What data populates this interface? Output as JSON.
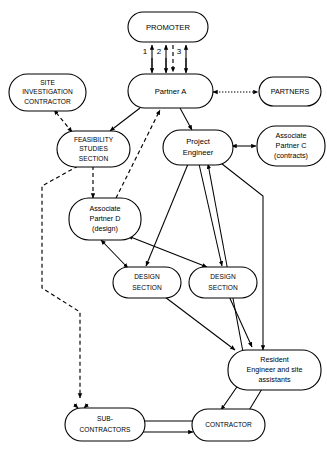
{
  "diagram": {
    "type": "flow-diagram",
    "background_color": "#ffffff",
    "line_color": "#000000",
    "nodes": [
      {
        "id": "promoter",
        "label": "PROMOTER",
        "lines": [
          "PROMOTER"
        ]
      },
      {
        "id": "partner_a",
        "label": "Partner A",
        "lines": [
          "Partner A"
        ]
      },
      {
        "id": "site_inv",
        "label": "SITE INVESTIGATION CONTRACTOR",
        "lines": [
          "SITE",
          "INVESTIGATION",
          "CONTRACTOR"
        ]
      },
      {
        "id": "partners",
        "label": "PARTNERS",
        "lines": [
          "PARTNERS"
        ]
      },
      {
        "id": "feasibility",
        "label": "FEASIBILITY STUDIES SECTION",
        "lines": [
          "FEASIBILITY",
          "STUDIES",
          "SECTION"
        ]
      },
      {
        "id": "proj_eng",
        "label": "Project Engineer",
        "lines": [
          "Project",
          "Engineer"
        ]
      },
      {
        "id": "assoc_c",
        "label": "Associate Partner C (contracts)",
        "lines": [
          "Associate",
          "Partner C",
          "(contracts)"
        ]
      },
      {
        "id": "assoc_d",
        "label": "Associate Partner D (design)",
        "lines": [
          "Associate",
          "Partner D",
          "(design)"
        ]
      },
      {
        "id": "design_1",
        "label": "DESIGN SECTION",
        "lines": [
          "DESIGN",
          "SECTION"
        ]
      },
      {
        "id": "design_2",
        "label": "DESIGN SECTION",
        "lines": [
          "DESIGN",
          "SECTION"
        ]
      },
      {
        "id": "resident",
        "label": "Resident Engineer and site assistants",
        "lines": [
          "Resident",
          "Engineer and site",
          "assistants"
        ]
      },
      {
        "id": "subcontr",
        "label": "SUB-CONTRACTORS",
        "lines": [
          "SUB-",
          "CONTRACTORS"
        ]
      },
      {
        "id": "contractor",
        "label": "CONTRACTOR",
        "lines": [
          "CONTRACTOR"
        ]
      }
    ],
    "channel_numbers": [
      "1",
      "2",
      "3"
    ],
    "edges": [
      {
        "from": "partner_a",
        "to": "promoter",
        "style": "solid",
        "channel": "1"
      },
      {
        "from": "partner_a",
        "to": "promoter",
        "style": "solid",
        "channel": "2"
      },
      {
        "from": "promoter",
        "to": "partner_a",
        "style": "dashed",
        "channel": "2"
      },
      {
        "from": "partner_a",
        "to": "promoter",
        "style": "solid",
        "channel": "3"
      },
      {
        "from": "promoter",
        "to": "partner_a",
        "style": "solid",
        "channel": "3"
      },
      {
        "from": "partner_a",
        "to": "partners",
        "style": "dotted",
        "bidirectional": true
      },
      {
        "from": "feasibility",
        "to": "site_inv",
        "style": "dashed",
        "bidirectional": true
      },
      {
        "from": "partner_a",
        "to": "feasibility",
        "style": "solid"
      },
      {
        "from": "partner_a",
        "to": "proj_eng",
        "style": "solid"
      },
      {
        "from": "assoc_d",
        "to": "partner_a",
        "style": "dashed"
      },
      {
        "from": "proj_eng",
        "to": "assoc_c",
        "style": "solid",
        "bidirectional": true
      },
      {
        "from": "feasibility",
        "to": "assoc_d",
        "style": "dashed"
      },
      {
        "from": "assoc_d",
        "to": "design_1",
        "style": "solid",
        "bidirectional": true
      },
      {
        "from": "assoc_d",
        "to": "design_2",
        "style": "solid",
        "bidirectional": true
      },
      {
        "from": "proj_eng",
        "to": "design_1",
        "style": "solid"
      },
      {
        "from": "proj_eng",
        "to": "design_2",
        "style": "solid"
      },
      {
        "from": "proj_eng",
        "to": "resident",
        "style": "solid",
        "bidirectional": true
      },
      {
        "from": "design_1",
        "to": "resident",
        "style": "solid"
      },
      {
        "from": "design_2",
        "to": "resident",
        "style": "solid"
      },
      {
        "from": "resident",
        "to": "contractor",
        "style": "solid",
        "bidirectional": true
      },
      {
        "from": "contractor",
        "to": "subcontr",
        "style": "solid",
        "bidirectional": true
      },
      {
        "from": "feasibility",
        "to": "subcontr",
        "style": "dashed"
      }
    ]
  }
}
